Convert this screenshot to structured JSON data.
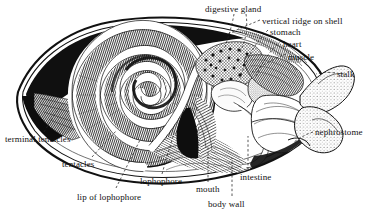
{
  "figure": {
    "type": "anatomical-cross-section",
    "style": "black-and-white line engraving with hatching and stippling",
    "background_color": "#ffffff",
    "ink_color": "#111111",
    "leader_line_style": "dashed"
  },
  "labels": [
    {
      "id": "digestive-gland",
      "text": "digestive gland",
      "x": 205,
      "y": 4,
      "anchor": "left"
    },
    {
      "id": "vertical-ridge-on-shell",
      "text": "vertical ridge on shell",
      "x": 262,
      "y": 16,
      "anchor": "left"
    },
    {
      "id": "stomach",
      "text": "stomach",
      "x": 270,
      "y": 27,
      "anchor": "left"
    },
    {
      "id": "heart",
      "text": "heart",
      "x": 283,
      "y": 39,
      "anchor": "left"
    },
    {
      "id": "muscle",
      "text": "muscle",
      "x": 288,
      "y": 52,
      "anchor": "left"
    },
    {
      "id": "stalk",
      "text": "stalk",
      "x": 337,
      "y": 74,
      "anchor": "left"
    },
    {
      "id": "nephrostome",
      "text": "nephrostome",
      "x": 315,
      "y": 131,
      "anchor": "left"
    },
    {
      "id": "terminal-tentacles",
      "text": "terminal tentacles",
      "x": 5,
      "y": 134,
      "anchor": "left"
    },
    {
      "id": "tentacles",
      "text": "tentacles",
      "x": 62,
      "y": 160,
      "anchor": "left"
    },
    {
      "id": "lip-of-lophophore",
      "text": "lip of lophophore",
      "x": 77,
      "y": 193,
      "anchor": "left"
    },
    {
      "id": "lophophore",
      "text": "lophophore",
      "x": 140,
      "y": 178,
      "anchor": "left"
    },
    {
      "id": "mouth",
      "text": "mouth",
      "x": 196,
      "y": 185,
      "anchor": "left"
    },
    {
      "id": "intestine",
      "text": "intestine",
      "x": 240,
      "y": 174,
      "anchor": "left"
    },
    {
      "id": "body-wall",
      "text": "body wall",
      "x": 208,
      "y": 200,
      "anchor": "left"
    }
  ]
}
